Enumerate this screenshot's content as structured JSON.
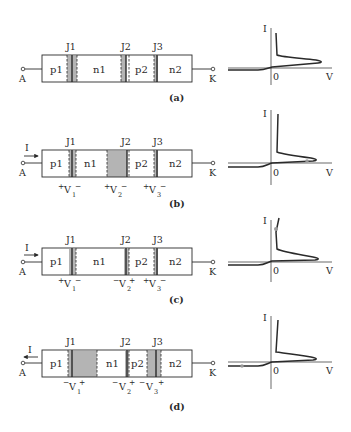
{
  "panels": [
    {
      "id": "a",
      "caption": "(a)",
      "current_label": "",
      "current_direction": "none",
      "terminals": {
        "anode": "A",
        "cathode": "K"
      },
      "junctions": [
        "J1",
        "J2",
        "J3"
      ],
      "regions": [
        "p1",
        "n1",
        "p2",
        "n2"
      ],
      "voltages": [],
      "depletion": "narrow-all",
      "graph": {
        "y_label": "I",
        "x_label": "V",
        "origin_label": "0",
        "operating_point": "none"
      }
    },
    {
      "id": "b",
      "caption": "(b)",
      "current_label": "I",
      "current_direction": "right",
      "terminals": {
        "anode": "A",
        "cathode": "K"
      },
      "junctions": [
        "J1",
        "J2",
        "J3"
      ],
      "regions": [
        "p1",
        "n1",
        "p2",
        "n2"
      ],
      "voltages": [
        {
          "left": "+",
          "name": "V",
          "sub": "1",
          "right": "−"
        },
        {
          "left": "+",
          "name": "V",
          "sub": "2",
          "right": "−"
        },
        {
          "left": "+",
          "name": "V",
          "sub": "3",
          "right": "−"
        }
      ],
      "depletion": "wide-J2",
      "graph": {
        "y_label": "I",
        "x_label": "V",
        "origin_label": "0",
        "operating_point": "forward-blocking"
      }
    },
    {
      "id": "c",
      "caption": "(c)",
      "current_label": "I",
      "current_direction": "right",
      "terminals": {
        "anode": "A",
        "cathode": "K"
      },
      "junctions": [
        "J1",
        "J2",
        "J3"
      ],
      "regions": [
        "p1",
        "n1",
        "p2",
        "n2"
      ],
      "voltages": [
        {
          "left": "+",
          "name": "V",
          "sub": "1",
          "right": "−"
        },
        {
          "left": "−",
          "name": "V",
          "sub": "2",
          "right": "+"
        },
        {
          "left": "+",
          "name": "V",
          "sub": "3",
          "right": "−"
        }
      ],
      "depletion": "narrow-all",
      "graph": {
        "y_label": "I",
        "x_label": "V",
        "origin_label": "0",
        "operating_point": "on-state"
      }
    },
    {
      "id": "d",
      "caption": "(d)",
      "current_label": "I",
      "current_direction": "left",
      "terminals": {
        "anode": "A",
        "cathode": "K"
      },
      "junctions": [
        "J1",
        "J2",
        "J3"
      ],
      "regions": [
        "p1",
        "n1",
        "p2",
        "n2"
      ],
      "voltages": [
        {
          "left": "−",
          "name": "V",
          "sub": "1",
          "right": "+"
        },
        {
          "left": "−",
          "name": "V",
          "sub": "2",
          "right": "+"
        },
        {
          "left": "−",
          "name": "V",
          "sub": "3",
          "right": "+"
        }
      ],
      "depletion": "wide-J1-J3",
      "graph": {
        "y_label": "I",
        "x_label": "V",
        "origin_label": "0",
        "operating_point": "reverse-blocking"
      }
    }
  ],
  "colors": {
    "ink": "#2a2a2a",
    "depletion": "#b4b4b4",
    "junction_fill": "#8c8c8c",
    "op_point": "#9a9a9a"
  }
}
